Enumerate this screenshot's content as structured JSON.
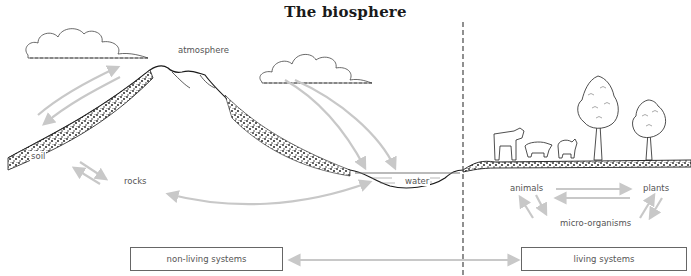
{
  "title": "The biosphere",
  "divider": {
    "style": "dashed",
    "color": "#555555"
  },
  "labels": {
    "atmosphere": "atmosphere",
    "soil": "soil",
    "rocks": "rocks",
    "water": "water",
    "animals": "animals",
    "plants": "plants",
    "micro_organisms": "micro-organisms"
  },
  "boxes": {
    "non_living": "non-living systems",
    "living": "living systems"
  },
  "colors": {
    "arrow": "#c8c8c8",
    "outline": "#1a1a1a",
    "text": "#555555",
    "box_border": "#666666"
  }
}
